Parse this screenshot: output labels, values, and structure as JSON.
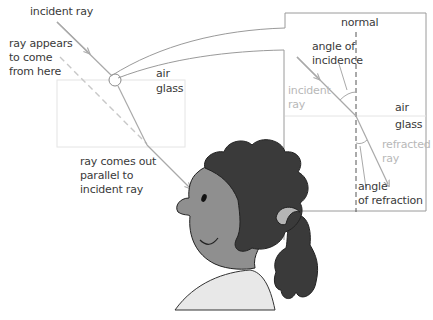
{
  "colors": {
    "ray": "#a9a9a9",
    "ray_dashed": "#c8c8c8",
    "outline": "#9a9a9a",
    "glass_edge": "#e4e4e4",
    "hair": "#3a3a3a",
    "skin": "#8f8f8f",
    "shirt": "#e8e8e8",
    "hair_band": "#b5b5b5",
    "text": "#3a3a3a",
    "text_light": "#b8b8b8"
  },
  "main_view": {
    "incident_ray_label": "incident ray",
    "apparent_ray_label": [
      "ray appears",
      "to come",
      "from here"
    ],
    "medium_top": "air",
    "medium_bottom": "glass",
    "exit_ray_label": [
      "ray comes out",
      "parallel to",
      "incident ray"
    ]
  },
  "magnified_panel": {
    "normal_label": "normal",
    "angle_incidence_label": [
      "angle of",
      "incidence"
    ],
    "incident_ray_label": [
      "incident",
      "ray"
    ],
    "medium_top": "air",
    "medium_bottom": "glass",
    "refracted_ray_label": [
      "refracted",
      "ray"
    ],
    "angle_refraction_label": [
      "angle",
      "of refraction"
    ]
  }
}
